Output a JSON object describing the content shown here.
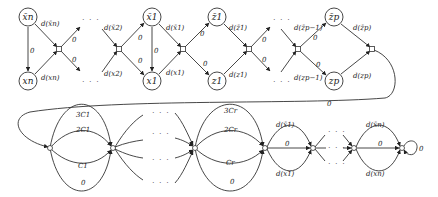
{
  "diagram": {
    "top_row": {
      "vertices": [
        {
          "id": "xbar_n",
          "label": "x̄n",
          "pos": [
            28,
            17
          ]
        },
        {
          "id": "x_n",
          "label": "xn",
          "pos": [
            28,
            81
          ]
        },
        {
          "id": "xbar_1",
          "label": "x̄1",
          "pos": [
            152,
            17
          ]
        },
        {
          "id": "x_1",
          "label": "x1",
          "pos": [
            152,
            81
          ]
        },
        {
          "id": "zbar_1",
          "label": "z̄1",
          "pos": [
            217,
            17
          ]
        },
        {
          "id": "z_1",
          "label": "z1",
          "pos": [
            217,
            81
          ]
        },
        {
          "id": "zbar_p",
          "label": "z̄p",
          "pos": [
            334,
            17
          ]
        },
        {
          "id": "z_p",
          "label": "zp",
          "pos": [
            334,
            81
          ]
        }
      ],
      "edge_labels": {
        "d_xbar_n": "d(x̄n)",
        "d_x_n": "d(xn)",
        "zero_n": "0",
        "zero_out_n_up": "0",
        "zero_out_n_down": "0",
        "d_xbar_2": "d(x̄2)",
        "d_x_2": "d(x2)",
        "zero_2_up": "0",
        "zero_2_down": "0",
        "zero_1": "0",
        "d_xbar_1": "d(x̄1)",
        "d_x_1": "d(x1)",
        "zero_j1_up": "0",
        "zero_j1_down": "0",
        "d_zbar_1": "d(z̄1)",
        "d_z_1": "d(z1)",
        "zero_j2_up": "0",
        "zero_j2_down": "0",
        "d_zbar_p_1": "d(z̄p−1)",
        "d_z_p_1": "d(zp−1)",
        "zero_jp_up": "0",
        "zero_jp_down": "0",
        "d_zbar_p": "d(z̄p)",
        "d_z_p": "d(zp)",
        "connector": "0"
      },
      "ellipsis": "· · ·"
    },
    "bottom_row": {
      "clause_1": {
        "top": "3C1",
        "upper": "2C1",
        "lower": "C1",
        "bottom": "0"
      },
      "clause_r": {
        "top": "3Cr",
        "upper": "2Cr",
        "lower": "Cr",
        "bottom": "0"
      },
      "var_1": {
        "top": "d(x̄1)",
        "mid": "0",
        "bottom": "d(x1)"
      },
      "var_n": {
        "top": "d(x̄n)",
        "mid": "0",
        "bottom": "d(xn)"
      },
      "self_loop": "0",
      "ellipsis": "· · ·"
    }
  }
}
